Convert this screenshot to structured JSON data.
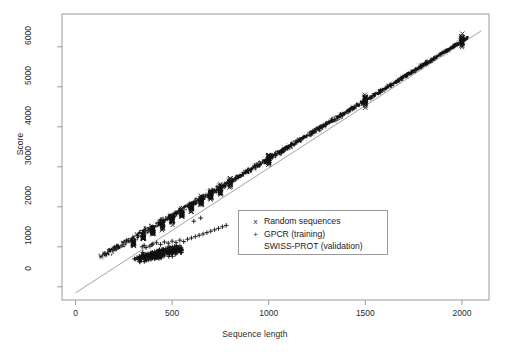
{
  "chart_data": {
    "type": "scatter",
    "title": "",
    "xlabel": "Sequence length",
    "ylabel": "Score",
    "xlim": [
      -70,
      2140
    ],
    "ylim": [
      -330,
      6820
    ],
    "xticks": [
      0,
      500,
      1000,
      1500,
      2000
    ],
    "yticks": [
      0,
      1000,
      2000,
      3000,
      4000,
      5000,
      6000
    ],
    "xtick_labels": [
      "0",
      "500",
      "1000",
      "1500",
      "2000"
    ],
    "ytick_labels": [
      "0",
      "1000",
      "2000",
      "3000",
      "4000",
      "5000",
      "6000"
    ],
    "grid": false,
    "frame": true,
    "legend_position": "center",
    "series": [
      {
        "name": "Random sequences",
        "marker": "x",
        "color": "#1a1a1a",
        "description": "Dense vertical clusters of random sequences sampled at discrete lengths, lying on the main diagonal band",
        "clusters": [
          {
            "x": 300,
            "y_center": 1080,
            "y_spread": 110,
            "n": 26
          },
          {
            "x": 350,
            "y_center": 1230,
            "y_spread": 115,
            "n": 26
          },
          {
            "x": 400,
            "y_center": 1380,
            "y_spread": 120,
            "n": 28
          },
          {
            "x": 450,
            "y_center": 1530,
            "y_spread": 120,
            "n": 28
          },
          {
            "x": 500,
            "y_center": 1680,
            "y_spread": 125,
            "n": 30
          },
          {
            "x": 550,
            "y_center": 1830,
            "y_spread": 125,
            "n": 28
          },
          {
            "x": 600,
            "y_center": 1980,
            "y_spread": 130,
            "n": 28
          },
          {
            "x": 650,
            "y_center": 2130,
            "y_spread": 130,
            "n": 26
          },
          {
            "x": 700,
            "y_center": 2280,
            "y_spread": 135,
            "n": 26
          },
          {
            "x": 750,
            "y_center": 2430,
            "y_spread": 135,
            "n": 24
          },
          {
            "x": 800,
            "y_center": 2580,
            "y_spread": 140,
            "n": 24
          },
          {
            "x": 1000,
            "y_center": 3180,
            "y_spread": 150,
            "n": 34
          },
          {
            "x": 1500,
            "y_center": 4660,
            "y_spread": 170,
            "n": 34
          },
          {
            "x": 2000,
            "y_center": 6150,
            "y_spread": 185,
            "n": 34
          }
        ]
      },
      {
        "name": "GPCR (training)",
        "marker": "+",
        "color": "#1a1a1a",
        "description": "Cluster of GPCR training sequences lying below the main band, concentrated between lengths 300 and 800",
        "points": [
          [
            305,
            700
          ],
          [
            312,
            690
          ],
          [
            318,
            730
          ],
          [
            325,
            705
          ],
          [
            330,
            760
          ],
          [
            336,
            720
          ],
          [
            342,
            780
          ],
          [
            348,
            745
          ],
          [
            352,
            800
          ],
          [
            358,
            755
          ],
          [
            364,
            815
          ],
          [
            370,
            770
          ],
          [
            375,
            830
          ],
          [
            381,
            790
          ],
          [
            388,
            845
          ],
          [
            393,
            805
          ],
          [
            399,
            860
          ],
          [
            404,
            820
          ],
          [
            410,
            880
          ],
          [
            416,
            835
          ],
          [
            421,
            895
          ],
          [
            427,
            850
          ],
          [
            433,
            910
          ],
          [
            438,
            865
          ],
          [
            444,
            925
          ],
          [
            450,
            880
          ],
          [
            455,
            940
          ],
          [
            461,
            895
          ],
          [
            467,
            955
          ],
          [
            472,
            905
          ],
          [
            478,
            970
          ],
          [
            484,
            920
          ],
          [
            490,
            985
          ],
          [
            495,
            935
          ],
          [
            501,
            1000
          ],
          [
            507,
            950
          ],
          [
            513,
            1015
          ],
          [
            518,
            965
          ],
          [
            524,
            1030
          ],
          [
            530,
            980
          ],
          [
            400,
            1070
          ],
          [
            420,
            1100
          ],
          [
            440,
            1060
          ],
          [
            460,
            1120
          ],
          [
            480,
            1090
          ],
          [
            500,
            1140
          ],
          [
            520,
            1110
          ],
          [
            540,
            1165
          ],
          [
            560,
            1130
          ],
          [
            580,
            1190
          ],
          [
            600,
            1220
          ],
          [
            620,
            1255
          ],
          [
            640,
            1290
          ],
          [
            660,
            1320
          ],
          [
            680,
            1355
          ],
          [
            700,
            1390
          ],
          [
            720,
            1425
          ],
          [
            740,
            1460
          ],
          [
            760,
            1500
          ],
          [
            780,
            1535
          ],
          [
            345,
            1000
          ],
          [
            355,
            1035
          ],
          [
            365,
            980
          ],
          [
            385,
            1015
          ],
          [
            395,
            1050
          ],
          [
            612,
            1640
          ],
          [
            648,
            1720
          ]
        ]
      },
      {
        "name": "SWISS-PROT (validation)",
        "marker": ".",
        "color": "#c0c0c0",
        "description": "Faint light-grey points densely tracing the main diagonal band across the full length range"
      }
    ],
    "reference_line": {
      "description": "Thin straight regression/reference line from lower-left through the data band to the upper right",
      "from": [
        0,
        -150
      ],
      "to": [
        2100,
        6400
      ]
    },
    "main_band": {
      "description": "Dark dense band of overlapping points following a slightly concave curve, flattening near the origin",
      "from": [
        120,
        540
      ],
      "to": [
        2030,
        6230
      ]
    }
  },
  "legend": {
    "items": [
      {
        "marker": "x",
        "label": "Random sequences"
      },
      {
        "marker": "+",
        "label": "GPCR (training)"
      },
      {
        "marker": "",
        "label": "SWISS-PROT (validation)"
      }
    ]
  },
  "axes": {
    "x_title": "Sequence length",
    "y_title": "Score"
  }
}
